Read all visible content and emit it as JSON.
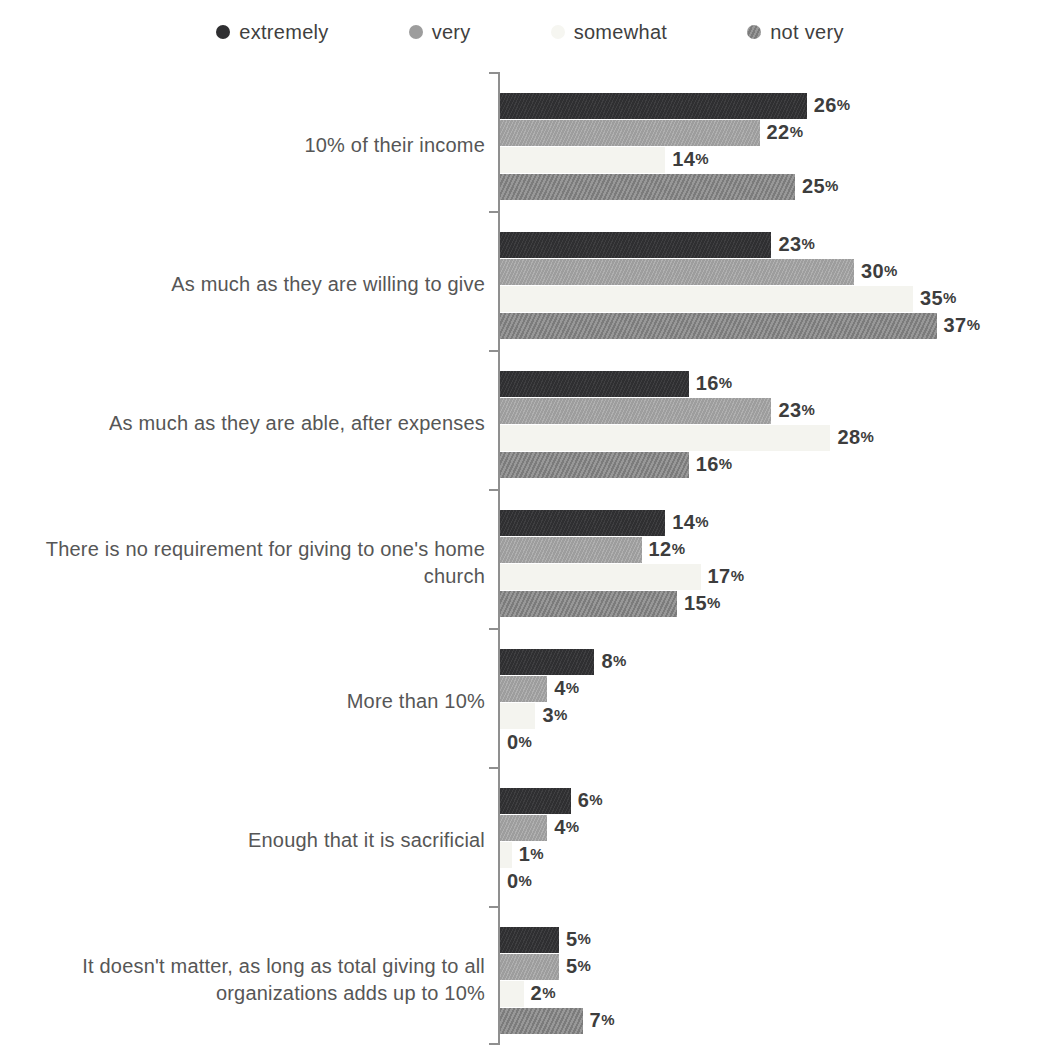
{
  "legend": [
    {
      "label": "extremely",
      "color": "#2f2f31",
      "swatch": "dark-solid-circle"
    },
    {
      "label": "very",
      "color": "#9d9d9d",
      "swatch": "gray-solid-circle"
    },
    {
      "label": "somewhat",
      "color": "#f6f6f1",
      "swatch": "white-circle"
    },
    {
      "label": "not very",
      "color": "#8a8a8a",
      "swatch": "striped-circle"
    }
  ],
  "chart_data": {
    "type": "bar",
    "orientation": "horizontal",
    "title": "",
    "xlabel": "",
    "ylabel": "",
    "unit": "%",
    "xlim": [
      0,
      40
    ],
    "grid": false,
    "legend_position": "top",
    "value_labels": "outside-end",
    "categories": [
      "10% of their income",
      "As much as they are willing to give",
      "As much as they are able, after expenses",
      "There is no requirement for giving to one's home church",
      "More than 10%",
      "Enough that it is sacrificial",
      "It doesn't matter, as long as total giving to all organizations adds up to 10%"
    ],
    "series": [
      {
        "name": "extremely",
        "values": [
          26,
          23,
          16,
          14,
          8,
          6,
          5
        ]
      },
      {
        "name": "very",
        "values": [
          22,
          30,
          23,
          12,
          4,
          4,
          5
        ]
      },
      {
        "name": "somewhat",
        "values": [
          14,
          35,
          28,
          17,
          3,
          1,
          2
        ]
      },
      {
        "name": "not very",
        "values": [
          25,
          37,
          16,
          15,
          0,
          0,
          7
        ]
      }
    ]
  },
  "axis": {
    "color": "#8f8f8f"
  }
}
